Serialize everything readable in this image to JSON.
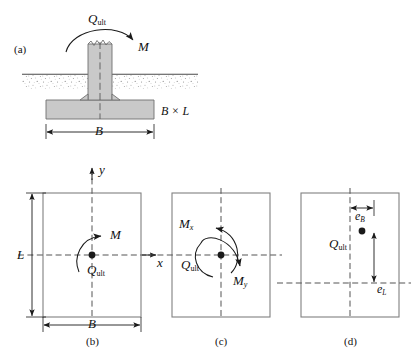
{
  "figure": {
    "colors": {
      "concrete_fill": "#c9c9c9",
      "outline": "#6f6f6f",
      "soil_stipple": "#9a9a9a",
      "axis_dash": "#444444",
      "arrow": "#1a1a1a",
      "load_dot": "#1a1a1a"
    }
  },
  "panel_a": {
    "caption": "(a)",
    "load_label": "Q",
    "load_sub": "ult",
    "moment_label": "M",
    "area_label": "B × L",
    "width_label": "B"
  },
  "panel_b": {
    "caption": "(b)",
    "axis_x": "x",
    "axis_y": "y",
    "moment_label": "M",
    "load_label": "Q",
    "load_sub": "ult",
    "length_label": "L",
    "width_label": "B"
  },
  "panel_c": {
    "caption": "(c)",
    "moment_x_label": "M",
    "moment_x_sub": "x",
    "moment_y_label": "M",
    "moment_y_sub": "y",
    "load_label": "Q",
    "load_sub": "ult"
  },
  "panel_d": {
    "caption": "(d)",
    "ecc_b_label": "e",
    "ecc_b_sub": "B",
    "ecc_l_label": "e",
    "ecc_l_sub": "L",
    "load_label": "Q",
    "load_sub": "ult"
  }
}
